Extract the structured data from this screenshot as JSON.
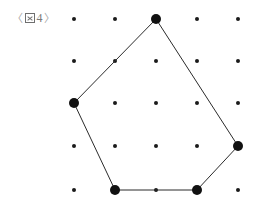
{
  "figure": {
    "caption": {
      "open_bracket": "〈",
      "glyph_name": "tofu-box-glyph",
      "glyph_text": "図",
      "number": "4",
      "close_bracket": "〉",
      "full_text": "〈図 4〉",
      "color": "#8e8e8e"
    },
    "canvas": {
      "width": 260,
      "height": 208,
      "background": "#ffffff"
    },
    "grid": {
      "name": "dot-lattice",
      "columns": 5,
      "rows": 5,
      "x_positions": [
        74,
        115,
        156,
        197,
        238
      ],
      "y_positions": [
        19,
        61,
        103,
        146,
        190
      ],
      "dot_radius": 2.0,
      "dot_color": "#1a1a1a"
    },
    "polygon": {
      "name": "pentagon",
      "sides": 5,
      "stroke_color": "#2b2b2b",
      "stroke_width": 1,
      "fill": "none",
      "vertex_radius": 5.0,
      "vertex_color": "#111111",
      "vertices": [
        {
          "label": "top",
          "col": 2,
          "row": 0,
          "x": 156,
          "y": 19
        },
        {
          "label": "right",
          "col": 4,
          "row": 3,
          "x": 238,
          "y": 146
        },
        {
          "label": "bottom-right",
          "col": 3,
          "row": 4,
          "x": 197,
          "y": 190
        },
        {
          "label": "bottom-left",
          "col": 1,
          "row": 4,
          "x": 115,
          "y": 190
        },
        {
          "label": "left",
          "col": 0,
          "row": 2,
          "x": 74,
          "y": 103
        }
      ]
    }
  }
}
